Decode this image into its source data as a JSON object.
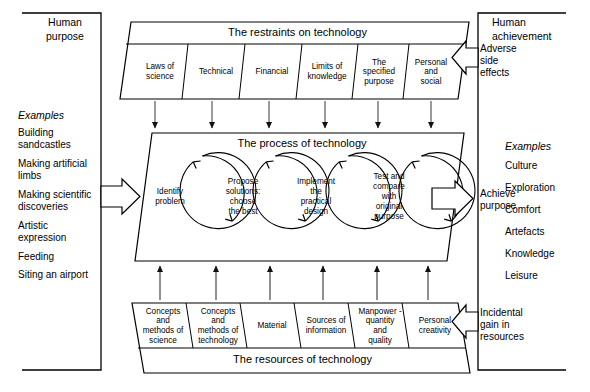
{
  "diagram": {
    "title_note": "A systems model of the technology process",
    "left_panel": {
      "heading": "Human\npurpose",
      "heading_line1": "Human",
      "heading_line2": "purpose",
      "examples_label": "Examples",
      "examples": [
        "Building\nsandcastles",
        "Making artificial\nlimbs",
        "Making scientific\ndiscoveries",
        "Artistic\nexpression",
        "Feeding",
        "Siting an airport"
      ]
    },
    "right_panel": {
      "heading_line1": "Human",
      "heading_line2": "achievement",
      "examples_label": "Examples",
      "examples": [
        "Culture",
        "Exploration",
        "Comfort",
        "Artefacts",
        "Knowledge",
        "Leisure"
      ]
    },
    "restraints": {
      "banner": "The restraints on technology",
      "cells": [
        "Laws of\nscience",
        "Technical",
        "Financial",
        "Limits of\nknowledge",
        "The\nspecified\npurpose",
        "Personal\nand\nsocial"
      ]
    },
    "process": {
      "banner": "The process of technology",
      "stages": [
        "Identify\nproblem",
        "Propose\nsolutions:\nchoose\nthe best",
        "Implement\nthe\npractical\ndesign",
        "Test and\ncompare\nwith\noriginal\npurpose"
      ]
    },
    "resources": {
      "banner": "The resources of technology",
      "cells": [
        "Concepts\nand\nmethods of\nscience",
        "Concepts\nand\nmethods of\ntechnology",
        "Material",
        "Sources of\ninformation",
        "Manpower -\nquantity\nand\nquality",
        "Personal\ncreativity"
      ]
    },
    "flow_labels": {
      "adverse": "Adverse\nside\neffects",
      "achieve": "Achieve\npurpose",
      "incidental": "Incidental\ngain in\nresources"
    },
    "colors": {
      "stroke": "#000000",
      "background": "#ffffff",
      "arrow_thin": "#3a3a3a"
    }
  }
}
